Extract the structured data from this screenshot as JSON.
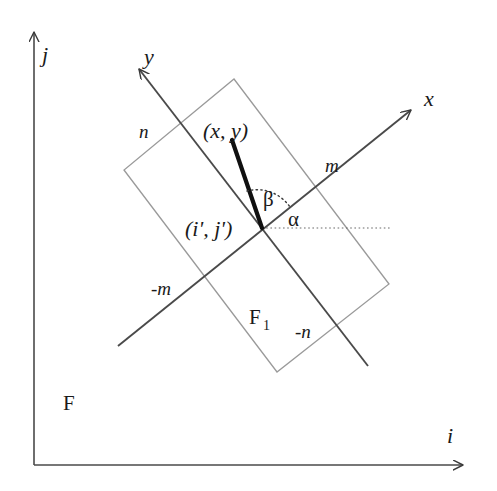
{
  "figure": {
    "background_color": "#ffffff",
    "ink_color": "#3a3a3a",
    "dark_ink_color": "#111111",
    "light_ink_color": "#8c8c8c",
    "width": 497,
    "height": 491
  },
  "global_frame": {
    "name": "F",
    "label": "F",
    "axis_i_label": "i",
    "axis_j_label": "j",
    "origin": {
      "x": 34,
      "y": 465
    },
    "axis_i_tip": {
      "x": 470,
      "y": 465
    },
    "axis_j_tip": {
      "x": 34,
      "y": 25
    },
    "axis_i_label_pos": {
      "x": 447,
      "y": 440
    },
    "axis_j_label_pos": {
      "x": 42,
      "y": 55
    },
    "label_pos": {
      "x": 63,
      "y": 408
    }
  },
  "local_frame": {
    "name": "F1",
    "label_main": "F",
    "label_sub": "1",
    "label_pos": {
      "x": 249,
      "y": 322
    },
    "origin_label": "(i', j')",
    "origin_label_pos": {
      "x": 186,
      "y": 236
    },
    "origin": {
      "x": 262,
      "y": 228
    },
    "axis_x_label": "x",
    "axis_y_label": "y",
    "axis_x_label_pos": {
      "x": 426,
      "y": 105
    },
    "axis_y_label_pos": {
      "x": 145,
      "y": 62
    },
    "axis_x_tip": {
      "x": 417,
      "y": 105
    },
    "axis_x_tail": {
      "x": 118,
      "y": 346
    },
    "axis_y_tip": {
      "x": 133,
      "y": 63
    },
    "axis_y_tail": {
      "x": 368,
      "y": 366
    },
    "rotation_note": "x axis points up-right, y axis points up-left"
  },
  "rectangle": {
    "name": "F1 region boundary",
    "corners": [
      {
        "name": "top",
        "x": 234,
        "y": 79
      },
      {
        "name": "right",
        "x": 389,
        "y": 284
      },
      {
        "name": "bottom",
        "x": 277,
        "y": 372
      },
      {
        "name": "left",
        "x": 124,
        "y": 170
      }
    ]
  },
  "tick_labels": [
    {
      "text": "n",
      "x": 141,
      "y": 131,
      "anchor_point": {
        "x": 175,
        "y": 123
      }
    },
    {
      "text": "m",
      "x": 327,
      "y": 166,
      "anchor_point": {
        "x": 351,
        "y": 172
      }
    },
    {
      "text": "-m",
      "x": 153,
      "y": 288,
      "anchor_point": {
        "x": 192,
        "y": 289
      }
    },
    {
      "text": "-n",
      "x": 297,
      "y": 331,
      "anchor_point": {
        "x": 335,
        "y": 325
      }
    }
  ],
  "point": {
    "label": "(x, y)",
    "label_pos": {
      "x": 205,
      "y": 131
    },
    "marker": {
      "x": 232,
      "y": 140
    },
    "line_from": {
      "x": 262,
      "y": 228
    },
    "line_to": {
      "x": 232,
      "y": 140
    }
  },
  "angles": [
    {
      "name": "alpha",
      "label": "α",
      "label_pos": {
        "x": 290,
        "y": 222
      },
      "description": "angle between horizontal dotted reference line and local x axis"
    },
    {
      "name": "beta",
      "label": "β",
      "label_pos": {
        "x": 265,
        "y": 203
      },
      "description": "angle between local x axis and the line to point (x, y)"
    }
  ],
  "reference_line": {
    "name": "horizontal dotted reference",
    "style": "dotted",
    "from": {
      "x": 262,
      "y": 228
    },
    "to": {
      "x": 390,
      "y": 228
    }
  }
}
